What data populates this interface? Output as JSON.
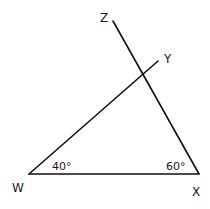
{
  "diagram": {
    "type": "geometry-triangle",
    "points": {
      "W": {
        "label": "W",
        "x": 29,
        "y": 174
      },
      "X": {
        "label": "X",
        "x": 199,
        "y": 174
      },
      "Y": {
        "label": "Y",
        "x": 158,
        "y": 61
      },
      "Z": {
        "label": "Z",
        "x": 113,
        "y": 21
      }
    },
    "segments": [
      {
        "name": "WX",
        "from": "W",
        "to": "X"
      },
      {
        "name": "WY",
        "from": "W",
        "to": "Y"
      },
      {
        "name": "XZ",
        "from": "X",
        "to": "Z"
      }
    ],
    "angles": [
      {
        "vertex": "W",
        "label": "40°"
      },
      {
        "vertex": "X",
        "label": "60°"
      }
    ],
    "stroke_color": "#111111",
    "background": "#ffffff"
  }
}
